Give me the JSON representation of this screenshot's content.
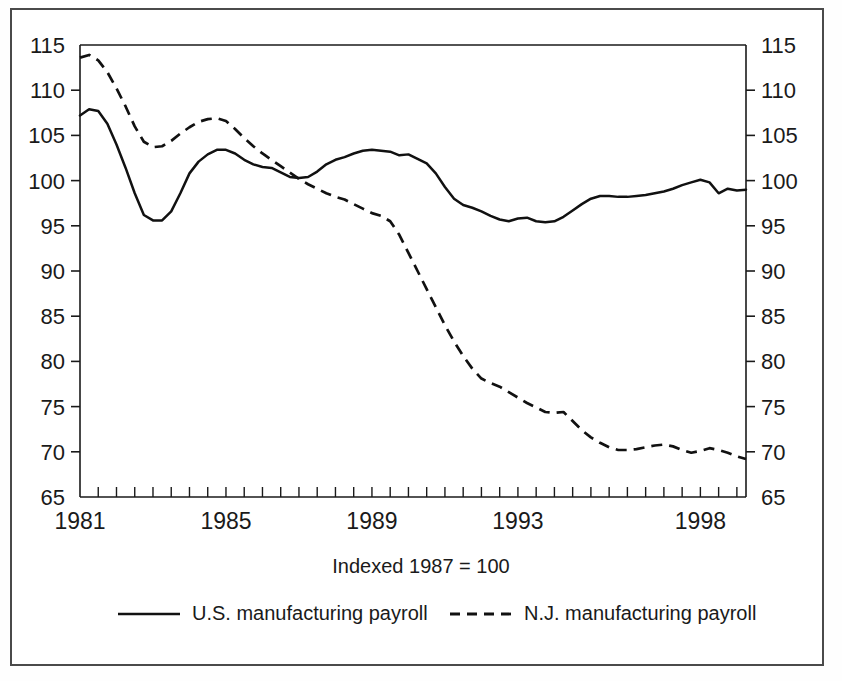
{
  "figure": {
    "caption": "Indexed 1987 = 100",
    "border_color": "#4a4a4a",
    "ink_color": "#111111"
  },
  "axes": {
    "y_ticks": [
      "115",
      "110",
      "105",
      "100",
      "95",
      "90",
      "85",
      "80",
      "75",
      "70",
      "65"
    ],
    "y_values": [
      115,
      110,
      105,
      100,
      95,
      90,
      85,
      80,
      75,
      70,
      65
    ],
    "y_min": 65,
    "y_max": 115,
    "x_ticks_labeled": [
      "1981",
      "1985",
      "1989",
      "1993",
      "1998"
    ],
    "x_tick_values": [
      1981,
      1985,
      1989,
      1993,
      1998
    ],
    "x_min": 1981,
    "x_max": 1999.25,
    "minor_tick_interval_years": 0.5
  },
  "legend": {
    "position": "below-caption",
    "entries": [
      {
        "label": "U.S. manufacturing payroll",
        "style": "solid"
      },
      {
        "label": "N.J. manufacturing payroll",
        "style": "dashed"
      }
    ]
  },
  "chart_data": {
    "type": "line",
    "title": "",
    "subtitle": "",
    "xlabel": "",
    "ylabel": "",
    "caption": "Indexed 1987 = 100",
    "xlim": [
      1981,
      1999.25
    ],
    "ylim": [
      65,
      115
    ],
    "grid": false,
    "legend_position": "bottom",
    "x_tick_labels": [
      "1981",
      "1985",
      "1989",
      "1993",
      "1998"
    ],
    "y_tick_labels": [
      "65",
      "70",
      "75",
      "80",
      "85",
      "90",
      "95",
      "100",
      "105",
      "110",
      "115"
    ],
    "series": [
      {
        "name": "U.S. manufacturing payroll",
        "style": "solid",
        "color": "#111111",
        "x": [
          1981.0,
          1981.25,
          1981.5,
          1981.75,
          1982.0,
          1982.25,
          1982.5,
          1982.75,
          1983.0,
          1983.25,
          1983.5,
          1983.75,
          1984.0,
          1984.25,
          1984.5,
          1984.75,
          1985.0,
          1985.25,
          1985.5,
          1985.75,
          1986.0,
          1986.25,
          1986.5,
          1986.75,
          1987.0,
          1987.25,
          1987.5,
          1987.75,
          1988.0,
          1988.25,
          1988.5,
          1988.75,
          1989.0,
          1989.25,
          1989.5,
          1989.75,
          1990.0,
          1990.25,
          1990.5,
          1990.75,
          1991.0,
          1991.25,
          1991.5,
          1991.75,
          1992.0,
          1992.25,
          1992.5,
          1992.75,
          1993.0,
          1993.25,
          1993.5,
          1993.75,
          1994.0,
          1994.25,
          1994.5,
          1994.75,
          1995.0,
          1995.25,
          1995.5,
          1995.75,
          1996.0,
          1996.25,
          1996.5,
          1996.75,
          1997.0,
          1997.25,
          1997.5,
          1997.75,
          1998.0,
          1998.25,
          1998.5,
          1998.75,
          1999.0,
          1999.25
        ],
        "y": [
          107.2,
          107.9,
          107.7,
          106.3,
          104.0,
          101.4,
          98.6,
          96.2,
          95.6,
          95.6,
          96.6,
          98.6,
          100.8,
          102.1,
          102.9,
          103.4,
          103.4,
          103.0,
          102.3,
          101.8,
          101.5,
          101.4,
          100.9,
          100.4,
          100.3,
          100.4,
          101.0,
          101.8,
          102.3,
          102.6,
          103.0,
          103.3,
          103.4,
          103.3,
          103.2,
          102.8,
          102.9,
          102.4,
          101.9,
          100.8,
          99.3,
          98.0,
          97.3,
          97.0,
          96.6,
          96.1,
          95.7,
          95.5,
          95.8,
          95.9,
          95.5,
          95.4,
          95.5,
          96.0,
          96.7,
          97.4,
          98.0,
          98.3,
          98.3,
          98.2,
          98.2,
          98.3,
          98.4,
          98.6,
          98.8,
          99.1,
          99.5,
          99.8,
          100.1,
          99.8,
          98.6,
          99.1,
          98.9,
          99.0
        ]
      },
      {
        "name": "N.J. manufacturing payroll",
        "style": "dashed",
        "color": "#111111",
        "x": [
          1981.0,
          1981.25,
          1981.5,
          1981.75,
          1982.0,
          1982.25,
          1982.5,
          1982.75,
          1983.0,
          1983.25,
          1983.5,
          1983.75,
          1984.0,
          1984.25,
          1984.5,
          1984.75,
          1985.0,
          1985.25,
          1985.5,
          1985.75,
          1986.0,
          1986.25,
          1986.5,
          1986.75,
          1987.0,
          1987.25,
          1987.5,
          1987.75,
          1988.0,
          1988.25,
          1988.5,
          1988.75,
          1989.0,
          1989.25,
          1989.5,
          1989.75,
          1990.0,
          1990.25,
          1990.5,
          1990.75,
          1991.0,
          1991.25,
          1991.5,
          1991.75,
          1992.0,
          1992.25,
          1992.5,
          1992.75,
          1993.0,
          1993.25,
          1993.5,
          1993.75,
          1994.0,
          1994.25,
          1994.5,
          1994.75,
          1995.0,
          1995.25,
          1995.5,
          1995.75,
          1996.0,
          1996.25,
          1996.5,
          1996.75,
          1997.0,
          1997.25,
          1997.5,
          1997.75,
          1998.0,
          1998.25,
          1998.5,
          1998.75,
          1999.0,
          1999.25
        ],
        "y": [
          113.6,
          113.9,
          113.3,
          112.0,
          110.2,
          108.2,
          106.0,
          104.3,
          103.7,
          103.8,
          104.4,
          105.2,
          105.9,
          106.5,
          106.8,
          106.9,
          106.6,
          105.7,
          104.7,
          103.8,
          103.0,
          102.3,
          101.6,
          100.9,
          100.2,
          99.6,
          99.1,
          98.6,
          98.2,
          97.9,
          97.4,
          96.9,
          96.4,
          96.1,
          95.5,
          94.0,
          92.0,
          90.0,
          88.0,
          86.0,
          84.0,
          82.2,
          80.6,
          79.2,
          78.1,
          77.6,
          77.2,
          76.6,
          76.0,
          75.4,
          74.9,
          74.4,
          74.3,
          74.4,
          73.4,
          72.4,
          71.6,
          71.0,
          70.5,
          70.2,
          70.2,
          70.3,
          70.5,
          70.7,
          70.8,
          70.6,
          70.2,
          69.9,
          70.1,
          70.4,
          70.2,
          69.9,
          69.5,
          69.2
        ]
      }
    ]
  }
}
